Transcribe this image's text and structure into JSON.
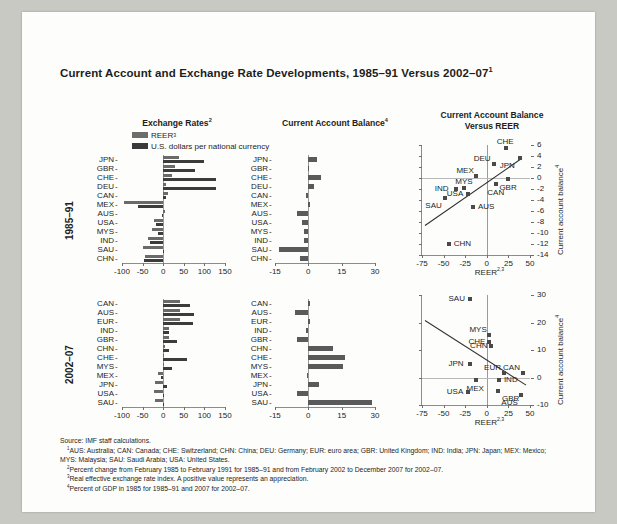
{
  "figure": {
    "title": "Current Account and Exchange Rate Developments, 1985–91 Versus 2002–07",
    "title_sup": "1",
    "source": "Source: IMF staff calculations.",
    "notes": [
      {
        "sup": "1",
        "text": "AUS: Australia; CAN: Canada; CHE: Switzerland; CHN: China; DEU: Germany; EUR: euro area; GBR: United Kingdom; IND: India; JPN: Japan; MEX: Mexico; MYS: Malaysia; SAU: Saudi Arabia; USA: United States."
      },
      {
        "sup": "2",
        "text": "Percent change from February 1985 to February 1991 for 1985–91 and from February 2002 to December 2007 for 2002–07."
      },
      {
        "sup": "3",
        "text": "Real effective exchange rate index. A positive value represents an appreciation."
      },
      {
        "sup": "4",
        "text": "Percent of GDP in 1985 for 1985–91 and 2007 for 2002–07."
      }
    ]
  },
  "column_titles": [
    {
      "label": "Exchange Rates",
      "sup": "2"
    },
    {
      "label": "Current Account Balance",
      "sup": "4"
    },
    {
      "label": "Current Account Balance\nVersus REER",
      "line1": "Current Account Balance",
      "line2": "Versus REER",
      "sup": ""
    }
  ],
  "legend": {
    "items": [
      {
        "label": "REER",
        "sup": "3",
        "color": "#6a6a6a",
        "swatch": "reer-swatch"
      },
      {
        "label": "U.S. dollars per national currency",
        "sup": "",
        "color": "#3c3c3c",
        "swatch": "usd-swatch"
      }
    ]
  },
  "row_labels": [
    "1985–91",
    "2002–07"
  ],
  "chart_data": [
    {
      "id": "exchange-rates-1985-91",
      "type": "bar",
      "orientation": "horizontal",
      "title": "Exchange Rates",
      "period": "1985–91",
      "xlabel": "",
      "ylabel": "",
      "xlim": [
        -100,
        150
      ],
      "xticks": [
        -100,
        -50,
        0,
        50,
        100,
        150
      ],
      "grid": false,
      "categories": [
        "JPN",
        "GBR",
        "CHE",
        "DEU",
        "CAN",
        "MEX",
        "AUS",
        "USA",
        "MYS",
        "IND",
        "SAU",
        "CHN"
      ],
      "series": [
        {
          "name": "REER",
          "color": "#6a6a6a",
          "values": [
            38,
            28,
            22,
            8,
            11,
            -95,
            4,
            -22,
            -26,
            -36,
            -48,
            -44
          ]
        },
        {
          "name": "U.S. dollars per national currency",
          "color": "#3c3c3c",
          "values": [
            100,
            78,
            127,
            129,
            6,
            -62,
            -4,
            -18,
            -13,
            -33,
            -1,
            -47
          ]
        }
      ]
    },
    {
      "id": "current-account-balance-1985-91",
      "type": "bar",
      "orientation": "horizontal",
      "title": "Current Account Balance",
      "period": "1985–91",
      "xlabel": "",
      "ylabel": "",
      "xlim": [
        -15,
        30
      ],
      "xticks": [
        -15,
        0,
        15,
        30
      ],
      "grid": false,
      "categories": [
        "JPN",
        "GBR",
        "CHE",
        "DEU",
        "CAN",
        "MEX",
        "AUS",
        "USA",
        "MYS",
        "IND",
        "SAU",
        "CHN"
      ],
      "series": [
        {
          "name": "Current account balance",
          "color": "#5a5a5a",
          "values": [
            3.7,
            -0.2,
            5.5,
            2.6,
            -1.0,
            0.4,
            -5.2,
            -2.9,
            -1.9,
            -2.0,
            -13.0,
            -3.8
          ]
        }
      ]
    },
    {
      "id": "ca-vs-reer-1985-91",
      "type": "scatter",
      "title": "Current Account Balance Versus REER",
      "period": "1985–91",
      "xlabel": "REER",
      "xlabel_sup": "2,3",
      "ylabel": "Current account balance",
      "ylabel_sup": "4",
      "xlim": [
        -75,
        50
      ],
      "ylim": [
        -14,
        6
      ],
      "xticks": [
        -75,
        -50,
        -25,
        0,
        25,
        50
      ],
      "yticks": [
        6,
        4,
        2,
        0,
        -2,
        -4,
        -6,
        -8,
        -10,
        -12,
        -14
      ],
      "grid": false,
      "trendline": {
        "x1": -72,
        "y1": -8.6,
        "x2": 40,
        "y2": 3.6
      },
      "points": [
        {
          "label": "CHE",
          "x": 22,
          "y": 5.5,
          "lab_pos": "above"
        },
        {
          "label": "DEU",
          "x": 8,
          "y": 2.6,
          "lab_pos": "above-left"
        },
        {
          "label": "JPN",
          "x": 38,
          "y": 3.7,
          "lab_pos": "below-left"
        },
        {
          "label": "MEX",
          "x": -12,
          "y": 0.4,
          "lab_pos": "above-left"
        },
        {
          "label": "MYS",
          "x": -26,
          "y": -1.9,
          "lab_pos": "above"
        },
        {
          "label": "IND",
          "x": -36,
          "y": -2.0,
          "lab_pos": "left"
        },
        {
          "label": "USA",
          "x": -22,
          "y": -2.9,
          "lab_pos": "left"
        },
        {
          "label": "GBR",
          "x": 25,
          "y": -0.2,
          "lab_pos": "below"
        },
        {
          "label": "CAN",
          "x": 11,
          "y": -1.0,
          "lab_pos": "below"
        },
        {
          "label": "SAU",
          "x": -48,
          "y": -3.6,
          "lab_pos": "below-left"
        },
        {
          "label": "AUS",
          "x": -16,
          "y": -5.2,
          "lab_pos": "right"
        },
        {
          "label": "CHN",
          "x": -44,
          "y": -12.0,
          "lab_pos": "right"
        }
      ]
    },
    {
      "id": "exchange-rates-2002-07",
      "type": "bar",
      "orientation": "horizontal",
      "title": "Exchange Rates",
      "period": "2002–07",
      "xlabel": "",
      "ylabel": "",
      "xlim": [
        -100,
        150
      ],
      "xticks": [
        -100,
        -50,
        0,
        50,
        100,
        150
      ],
      "grid": false,
      "categories": [
        "CAN",
        "AUS",
        "EUR",
        "IND",
        "GBR",
        "CHN",
        "CHE",
        "MYS",
        "MEX",
        "JPN",
        "USA",
        "SAU"
      ],
      "series": [
        {
          "name": "REER",
          "color": "#6a6a6a",
          "values": [
            42,
            40,
            41,
            14,
            13,
            5,
            3,
            3,
            -13,
            -20,
            -22,
            -20
          ]
        },
        {
          "name": "U.S. dollars per national currency",
          "color": "#3c3c3c",
          "values": [
            66,
            76,
            72,
            13,
            33,
            14,
            58,
            22,
            -6,
            9,
            0,
            0
          ]
        }
      ]
    },
    {
      "id": "current-account-balance-2002-07",
      "type": "bar",
      "orientation": "horizontal",
      "title": "Current Account Balance",
      "period": "2002–07",
      "xlabel": "",
      "ylabel": "",
      "xlim": [
        -15,
        30
      ],
      "xticks": [
        -15,
        0,
        15,
        30
      ],
      "grid": false,
      "categories": [
        "CAN",
        "AUS",
        "EUR",
        "IND",
        "GBR",
        "CHN",
        "CHE",
        "MYS",
        "MEX",
        "JPN",
        "USA",
        "SAU"
      ],
      "series": [
        {
          "name": "Current account balance",
          "color": "#5a5a5a",
          "values": [
            0.9,
            -6.2,
            0.2,
            -1.0,
            -4.9,
            11.3,
            16.3,
            15.4,
            -0.8,
            4.9,
            -5.3,
            28.5
          ]
        }
      ]
    },
    {
      "id": "ca-vs-reer-2002-07",
      "type": "scatter",
      "title": "Current Account Balance Versus REER",
      "period": "2002–07",
      "xlabel": "REER",
      "xlabel_sup": "2,3",
      "ylabel": "Current account balance",
      "ylabel_sup": "4",
      "xlim": [
        -75,
        50
      ],
      "ylim": [
        -10,
        30
      ],
      "xticks": [
        -75,
        -50,
        -25,
        0,
        25,
        50
      ],
      "yticks": [
        30,
        20,
        10,
        0,
        -10
      ],
      "grid": false,
      "trendline": {
        "x1": -72,
        "y1": 21.0,
        "x2": 45,
        "y2": -2.5
      },
      "points": [
        {
          "label": "SAU",
          "x": -20,
          "y": 28.5,
          "lab_pos": "left"
        },
        {
          "label": "MYS",
          "x": 3,
          "y": 15.4,
          "lab_pos": "above-left"
        },
        {
          "label": "CHE",
          "x": 3,
          "y": 13.0,
          "lab_pos": "left"
        },
        {
          "label": "CHN",
          "x": 5,
          "y": 11.3,
          "lab_pos": "left"
        },
        {
          "label": "JPN",
          "x": -20,
          "y": 4.9,
          "lab_pos": "left"
        },
        {
          "label": "EUR",
          "x": 20,
          "y": 1.6,
          "lab_pos": "above-left"
        },
        {
          "label": "CAN",
          "x": 42,
          "y": 1.8,
          "lab_pos": "above-left"
        },
        {
          "label": "MEX",
          "x": -13,
          "y": -0.8,
          "lab_pos": "below"
        },
        {
          "label": "IND",
          "x": 14,
          "y": -1.0,
          "lab_pos": "right"
        },
        {
          "label": "USA",
          "x": -22,
          "y": -5.3,
          "lab_pos": "left"
        },
        {
          "label": "GBR",
          "x": 13,
          "y": -4.9,
          "lab_pos": "below-right"
        },
        {
          "label": "AUS",
          "x": 40,
          "y": -6.2,
          "lab_pos": "below-left"
        }
      ]
    }
  ]
}
